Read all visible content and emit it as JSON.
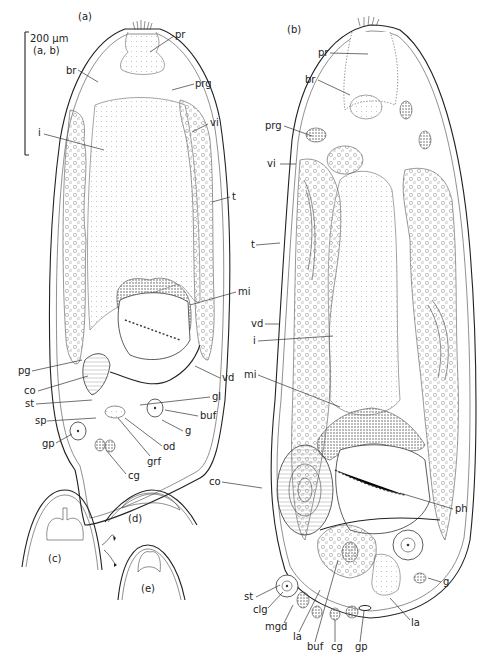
{
  "scale_bar": {
    "value": "200 μm",
    "applies_to": "(a, b)"
  },
  "panels": {
    "a": {
      "title": "(a)",
      "labels": {
        "pr": "pr",
        "br": "br",
        "prg": "prg",
        "vi": "vi",
        "i": "i",
        "t": "t",
        "mi": "mi",
        "pg": "pg",
        "co": "co",
        "vd": "vd",
        "st": "st",
        "gl": "gl",
        "buf": "buf",
        "sp": "sp",
        "g": "g",
        "gp": "gp",
        "od": "od",
        "grf": "grf",
        "cg": "cg"
      }
    },
    "b": {
      "title": "(b)",
      "labels": {
        "pr": "pr",
        "br": "br",
        "prg": "prg",
        "vi": "vi",
        "t": "t",
        "vd": "vd",
        "i": "i",
        "mi": "mi",
        "co": "co",
        "ph": "ph",
        "g": "g",
        "st": "st",
        "clg": "clg",
        "mgd": "mgd",
        "la1": "la",
        "buf": "buf",
        "cg": "cg",
        "gp": "gp",
        "la2": "la"
      }
    },
    "c": {
      "title": "(c)"
    },
    "d": {
      "title": "(d)"
    },
    "e": {
      "title": "(e)"
    }
  }
}
